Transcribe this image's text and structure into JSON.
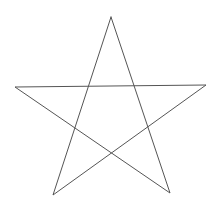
{
  "canvas": {
    "width": 220,
    "height": 211,
    "background": "#ffffff"
  },
  "shape": {
    "type": "pentagram",
    "stroke_color": "#555555",
    "stroke_width": 1,
    "fill": "none",
    "vertices": {
      "top": [
        111,
        17
      ],
      "right": [
        206,
        85
      ],
      "bottom_right": [
        170,
        193
      ],
      "bottom_left": [
        53,
        195
      ],
      "left": [
        15,
        87
      ]
    },
    "path_order": [
      "top",
      "bottom_right",
      "left",
      "right",
      "bottom_left",
      "top"
    ]
  }
}
